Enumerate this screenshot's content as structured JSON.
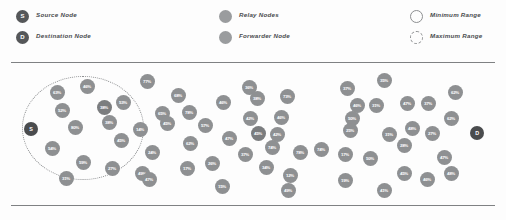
{
  "legend": {
    "columns": [
      {
        "items": [
          {
            "marker": "source-node-marker",
            "glyph": "S",
            "label": "Source Node"
          },
          {
            "marker": "destination-node-marker",
            "glyph": "D",
            "label": "Destination Node"
          }
        ]
      },
      {
        "items": [
          {
            "marker": "relay-nodes-marker",
            "glyph": "",
            "label": "Relay Nodes"
          },
          {
            "marker": "forwarder-node-marker",
            "glyph": "",
            "label": "Forwarder Node"
          }
        ]
      },
      {
        "items": [
          {
            "marker": "minimum-range-marker",
            "glyph": "",
            "label": "Minimum Range"
          },
          {
            "marker": "maximum-range-marker",
            "glyph": "",
            "label": "Maximum Range"
          }
        ]
      }
    ]
  },
  "colors": {
    "endpoint": "#4a4c4e",
    "relay": "#8e9092",
    "forwarder": "#7b7d7f",
    "rule": "#7f8183",
    "range_outline": "#8b8d8f",
    "background": "#fdfdfd"
  },
  "chart_data": {
    "type": "scatter",
    "title": "",
    "xlabel": "",
    "ylabel": "",
    "xlim": [
      0,
      506
    ],
    "ylim": [
      0,
      143
    ],
    "grid": false,
    "legend_position": "top",
    "annotations": [
      {
        "name": "maximum-range-circle",
        "shape": "ellipse",
        "cx": 83,
        "cy": 66,
        "rx": 61,
        "ry": 52,
        "style": "dotted"
      }
    ],
    "series": [
      {
        "name": "Source Node",
        "kind": "endpoint",
        "points": [
          {
            "label": "S",
            "x": 31,
            "y": 67
          }
        ]
      },
      {
        "name": "Destination Node",
        "kind": "endpoint",
        "points": [
          {
            "label": "D",
            "x": 477,
            "y": 71
          }
        ]
      },
      {
        "name": "Relay Nodes",
        "kind": "relay",
        "points": [
          {
            "label": "63%",
            "x": 57,
            "y": 30
          },
          {
            "label": "46%",
            "x": 87,
            "y": 24
          },
          {
            "label": "52%",
            "x": 62,
            "y": 48
          },
          {
            "label": "53%",
            "x": 123,
            "y": 40
          },
          {
            "label": "80%",
            "x": 75,
            "y": 65
          },
          {
            "label": "38%",
            "x": 109,
            "y": 60
          },
          {
            "label": "54%",
            "x": 52,
            "y": 86
          },
          {
            "label": "45%",
            "x": 121,
            "y": 78
          },
          {
            "label": "59%",
            "x": 83,
            "y": 100
          },
          {
            "label": "27%",
            "x": 112,
            "y": 106
          },
          {
            "label": "31%",
            "x": 66,
            "y": 116
          },
          {
            "label": "49%",
            "x": 142,
            "y": 111
          },
          {
            "label": "14%",
            "x": 140,
            "y": 67
          },
          {
            "label": "77%",
            "x": 147,
            "y": 19
          },
          {
            "label": "68%",
            "x": 178,
            "y": 33
          },
          {
            "label": "65%",
            "x": 162,
            "y": 51
          },
          {
            "label": "78%",
            "x": 189,
            "y": 50
          },
          {
            "label": "45%",
            "x": 167,
            "y": 61
          },
          {
            "label": "62%",
            "x": 190,
            "y": 81
          },
          {
            "label": "24%",
            "x": 152,
            "y": 90
          },
          {
            "label": "17%",
            "x": 187,
            "y": 106
          },
          {
            "label": "47%",
            "x": 149,
            "y": 117
          },
          {
            "label": "57%",
            "x": 205,
            "y": 63
          },
          {
            "label": "47%",
            "x": 229,
            "y": 76
          },
          {
            "label": "26%",
            "x": 212,
            "y": 101
          },
          {
            "label": "15%",
            "x": 222,
            "y": 124
          },
          {
            "label": "46%",
            "x": 223,
            "y": 40
          },
          {
            "label": "36%",
            "x": 249,
            "y": 25
          },
          {
            "label": "38%",
            "x": 257,
            "y": 36
          },
          {
            "label": "42%",
            "x": 250,
            "y": 56
          },
          {
            "label": "37%",
            "x": 245,
            "y": 92
          },
          {
            "label": "34%",
            "x": 266,
            "y": 105
          },
          {
            "label": "73%",
            "x": 287,
            "y": 34
          },
          {
            "label": "46%",
            "x": 281,
            "y": 55
          },
          {
            "label": "42%",
            "x": 277,
            "y": 72
          },
          {
            "label": "74%",
            "x": 272,
            "y": 85
          },
          {
            "label": "78%",
            "x": 300,
            "y": 90
          },
          {
            "label": "12%",
            "x": 290,
            "y": 113
          },
          {
            "label": "49%",
            "x": 288,
            "y": 128
          },
          {
            "label": "37%",
            "x": 347,
            "y": 26
          },
          {
            "label": "35%",
            "x": 384,
            "y": 18
          },
          {
            "label": "31%",
            "x": 376,
            "y": 43
          },
          {
            "label": "47%",
            "x": 407,
            "y": 41
          },
          {
            "label": "37%",
            "x": 428,
            "y": 41
          },
          {
            "label": "46%",
            "x": 357,
            "y": 43
          },
          {
            "label": "50%",
            "x": 352,
            "y": 56
          },
          {
            "label": "25%",
            "x": 350,
            "y": 68
          },
          {
            "label": "62%",
            "x": 455,
            "y": 30
          },
          {
            "label": "62%",
            "x": 451,
            "y": 56
          },
          {
            "label": "31%",
            "x": 389,
            "y": 72
          },
          {
            "label": "48%",
            "x": 412,
            "y": 66
          },
          {
            "label": "27%",
            "x": 432,
            "y": 71
          },
          {
            "label": "28%",
            "x": 404,
            "y": 83
          },
          {
            "label": "74%",
            "x": 321,
            "y": 87
          },
          {
            "label": "17%",
            "x": 345,
            "y": 92
          },
          {
            "label": "50%",
            "x": 370,
            "y": 96
          },
          {
            "label": "47%",
            "x": 444,
            "y": 95
          },
          {
            "label": "45%",
            "x": 404,
            "y": 111
          },
          {
            "label": "19%",
            "x": 345,
            "y": 118
          },
          {
            "label": "41%",
            "x": 384,
            "y": 128
          },
          {
            "label": "46%",
            "x": 427,
            "y": 117
          },
          {
            "label": "48%",
            "x": 451,
            "y": 111
          }
        ]
      },
      {
        "name": "Forwarder Node",
        "kind": "forwarder",
        "points": [
          {
            "label": "38%",
            "x": 104,
            "y": 45
          },
          {
            "label": "45%",
            "x": 258,
            "y": 71
          }
        ]
      }
    ]
  }
}
